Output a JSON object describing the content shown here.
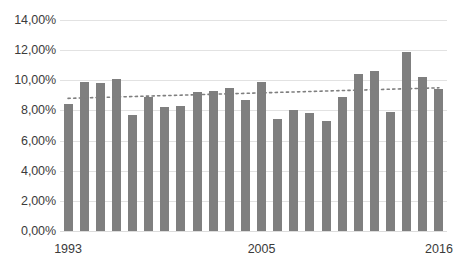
{
  "chart_data": {
    "type": "bar",
    "title": "",
    "subtitle": "",
    "xlabel": "",
    "ylabel": "",
    "ylim": [
      0,
      14
    ],
    "ytick_step": 2,
    "grid": true,
    "legend": false,
    "legend_position": "none",
    "value_suffix": "%",
    "decimal_separator": ",",
    "yticks": [
      0,
      2,
      4,
      6,
      8,
      10,
      12,
      14
    ],
    "ytick_labels": [
      "0,00%",
      "2,00%",
      "4,00%",
      "6,00%",
      "8,00%",
      "10,00%",
      "12,00%",
      "14,00%"
    ],
    "categories": [
      "1993",
      "1994",
      "1995",
      "1996",
      "1997",
      "1998",
      "1999",
      "2000",
      "2001",
      "2002",
      "2003",
      "2004",
      "2005",
      "2006",
      "2007",
      "2008",
      "2009",
      "2010",
      "2011",
      "2012",
      "2013",
      "2014",
      "2015",
      "2016"
    ],
    "xtick_labels": [
      "1993",
      "2005",
      "2016"
    ],
    "xtick_categories": [
      "1993",
      "2005",
      "2016"
    ],
    "values": [
      8.4,
      9.9,
      9.8,
      10.1,
      7.7,
      8.9,
      8.2,
      8.3,
      9.2,
      9.3,
      9.5,
      8.7,
      9.9,
      7.4,
      8.0,
      7.8,
      7.3,
      8.9,
      10.4,
      10.6,
      7.9,
      11.9,
      10.2,
      9.4
    ],
    "series": [
      {
        "name": "values",
        "kind": "bar",
        "color": "#7f7f7f",
        "values": [
          8.4,
          9.9,
          9.8,
          10.1,
          7.7,
          8.9,
          8.2,
          8.3,
          9.2,
          9.3,
          9.5,
          8.7,
          9.9,
          7.4,
          8.0,
          7.8,
          7.3,
          8.9,
          10.4,
          10.6,
          7.9,
          11.9,
          10.2,
          9.4
        ]
      },
      {
        "name": "trendline",
        "kind": "line",
        "style": "dotted",
        "color": "#7f7f7f",
        "start_value": 8.8,
        "end_value": 9.5
      }
    ],
    "colors": {
      "bar": "#7f7f7f",
      "trendline": "#7f7f7f",
      "gridline": "#e2e2e2",
      "axis_text": "#3b3b3b",
      "background": "#ffffff"
    }
  }
}
